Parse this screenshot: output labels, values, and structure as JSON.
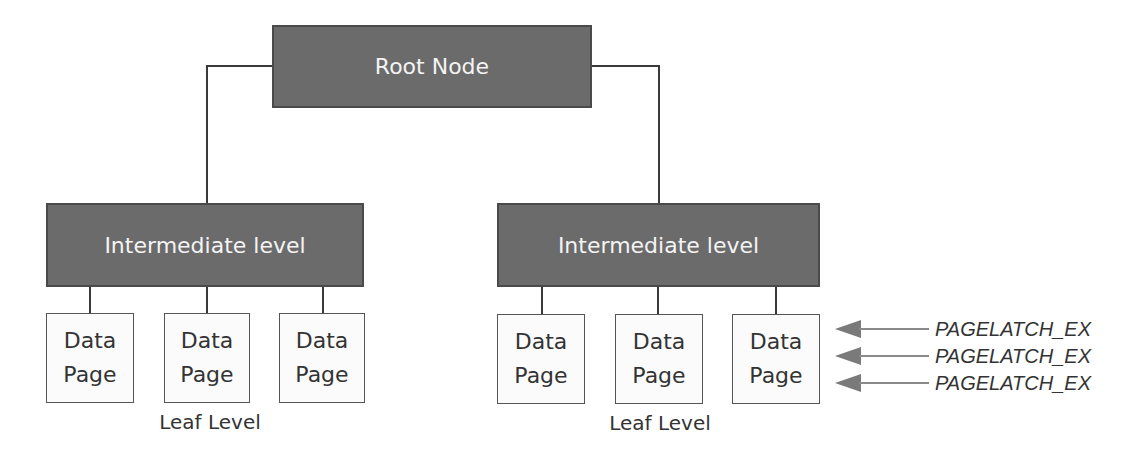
{
  "root": {
    "label": "Root Node"
  },
  "intermediate": [
    {
      "label": "Intermediate level"
    },
    {
      "label": "Intermediate level"
    }
  ],
  "pages": {
    "line1": "Data",
    "line2": "Page"
  },
  "leaf_labels": [
    "Leaf Level",
    "Leaf Level"
  ],
  "latches": [
    "PAGELATCH_EX",
    "PAGELATCH_EX",
    "PAGELATCH_EX"
  ],
  "colors": {
    "node_fill": "#6b6b6b",
    "arrow": "#7a7a7a",
    "line": "#3a3a3a"
  }
}
